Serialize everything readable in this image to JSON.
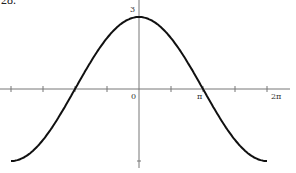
{
  "problem_number": "28.",
  "chart_data": {
    "type": "line",
    "title": "",
    "function": "y = 3cos(x/2)",
    "x": [
      -6.2832,
      -4.7124,
      -3.1416,
      -1.5708,
      0,
      1.5708,
      3.1416,
      4.7124,
      6.2832
    ],
    "series": [
      {
        "name": "y",
        "values": [
          -3,
          -2.121,
          0,
          2.121,
          3,
          2.121,
          0,
          -2.121,
          -3
        ]
      }
    ],
    "xlim": [
      -6.2832,
      6.2832
    ],
    "ylim": [
      -3,
      3
    ],
    "xtick_labels": [
      "0",
      "π",
      "2π"
    ],
    "ytick_labels": [
      "3"
    ],
    "grid": false,
    "xlabel": "",
    "ylabel": ""
  },
  "labels": {
    "zero": "0",
    "pi": "π",
    "two_pi": "2π",
    "three": "3"
  }
}
